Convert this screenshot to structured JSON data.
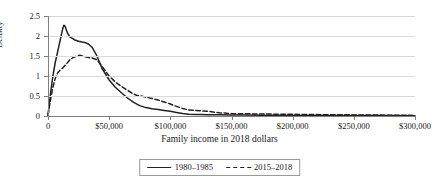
{
  "chart_data": {
    "type": "line",
    "title": "",
    "xlabel": "Family income in 2018 dollars",
    "ylabel": "Density",
    "xlim": [
      0,
      300000
    ],
    "ylim": [
      0,
      2.5
    ],
    "grid": "horizontal",
    "legend_position": "bottom-center",
    "x_ticks": [
      0,
      50000,
      100000,
      150000,
      200000,
      250000,
      300000
    ],
    "x_tick_labels": [
      "0",
      "$50,000",
      "$100,000",
      "$150,000",
      "$200,000",
      "$250,000",
      "$300,000"
    ],
    "y_ticks": [
      0,
      0.5,
      1,
      1.5,
      2,
      2.5
    ],
    "y_tick_labels": [
      "0",
      "0.5",
      "1",
      "1.5",
      "2",
      "2.5"
    ],
    "series": [
      {
        "name": "1980–1985",
        "style": "solid",
        "color": "#222222",
        "x": [
          0,
          2000,
          4000,
          6000,
          8000,
          10000,
          12000,
          13000,
          14000,
          16000,
          18000,
          20000,
          22000,
          25000,
          28000,
          30000,
          33000,
          36000,
          40000,
          44000,
          47000,
          50000,
          55000,
          60000,
          65000,
          70000,
          75000,
          80000,
          85000,
          90000,
          95000,
          100000,
          105000,
          110000,
          115000,
          120000,
          125000,
          130000,
          140000,
          150000,
          160000,
          175000,
          190000,
          205000,
          220000,
          240000,
          260000,
          280000,
          300000
        ],
        "y": [
          0.02,
          0.55,
          1.0,
          1.35,
          1.62,
          1.9,
          2.18,
          2.27,
          2.24,
          2.07,
          1.97,
          1.94,
          1.9,
          1.87,
          1.85,
          1.84,
          1.8,
          1.72,
          1.5,
          1.2,
          1.05,
          0.9,
          0.72,
          0.58,
          0.45,
          0.34,
          0.26,
          0.21,
          0.18,
          0.16,
          0.14,
          0.12,
          0.09,
          0.06,
          0.045,
          0.04,
          0.035,
          0.03,
          0.03,
          0.025,
          0.025,
          0.02,
          0.02,
          0.015,
          0.015,
          0.012,
          0.01,
          0.01,
          0.008
        ]
      },
      {
        "name": "2015–2018",
        "style": "dashed",
        "color": "#222222",
        "x": [
          0,
          2000,
          4000,
          6000,
          8000,
          10000,
          12000,
          15000,
          18000,
          21000,
          24000,
          26000,
          28000,
          30000,
          33000,
          36000,
          40000,
          44000,
          47000,
          50000,
          55000,
          60000,
          65000,
          70000,
          73000,
          76000,
          80000,
          85000,
          90000,
          95000,
          100000,
          105000,
          110000,
          115000,
          120000,
          125000,
          130000,
          140000,
          150000,
          160000,
          175000,
          190000,
          205000,
          220000,
          240000,
          260000,
          280000,
          300000
        ],
        "y": [
          0.02,
          0.4,
          0.72,
          0.95,
          1.08,
          1.15,
          1.2,
          1.3,
          1.41,
          1.47,
          1.5,
          1.52,
          1.5,
          1.48,
          1.46,
          1.45,
          1.41,
          1.25,
          1.12,
          1.0,
          0.85,
          0.74,
          0.64,
          0.55,
          0.51,
          0.5,
          0.47,
          0.44,
          0.4,
          0.35,
          0.3,
          0.24,
          0.19,
          0.15,
          0.14,
          0.13,
          0.12,
          0.08,
          0.06,
          0.055,
          0.05,
          0.045,
          0.04,
          0.035,
          0.03,
          0.025,
          0.02,
          0.015
        ]
      }
    ]
  },
  "axes": {
    "y_title": "Density",
    "x_title": "Family income in 2018 dollars"
  },
  "legend": {
    "items": [
      {
        "label": "1980–1985",
        "style": "solid"
      },
      {
        "label": "2015–2018",
        "style": "dashed"
      }
    ]
  }
}
